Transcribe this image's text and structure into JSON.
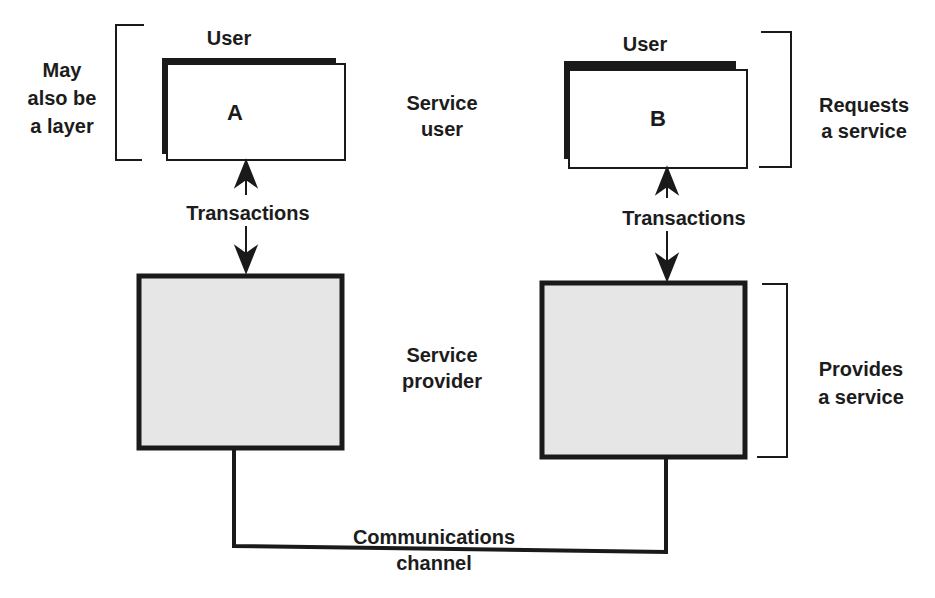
{
  "diagram": {
    "type": "layered-service-model",
    "colors": {
      "line": "#1a1a1a",
      "provider_fill": "#e6e6e6",
      "user_fill": "#ffffff",
      "background": "#ffffff"
    },
    "left": {
      "user_title": "User",
      "user_box_label": "A",
      "bracket_label": "May\nalso be\na layer",
      "role_user": "Service\nuser",
      "arrow_label": "Transactions",
      "role_provider": "Service\nprovider"
    },
    "right": {
      "user_title": "User",
      "user_box_label": "B",
      "bracket_top_label": "Requests\na service",
      "arrow_label": "Transactions",
      "bracket_bottom_label": "Provides\na service"
    },
    "channel_label": "Communications\nchannel"
  }
}
